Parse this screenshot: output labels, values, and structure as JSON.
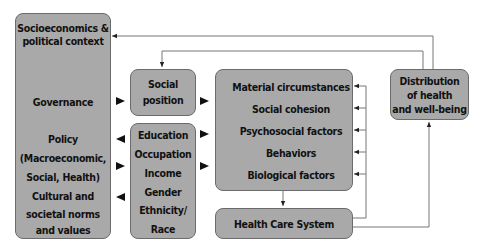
{
  "diagram": {
    "context_box": {
      "title_line1": "Socioeconomics &",
      "title_line2": "political context",
      "governance": "Governance",
      "policy_line1": "Policy",
      "policy_line2": "(Macroeconomic,",
      "policy_line3": "Social, Health)",
      "culture_line1": "Cultural and",
      "culture_line2": "societal norms",
      "culture_line3": "and values"
    },
    "social_position_box": {
      "line1": "Social",
      "line2": "position"
    },
    "stratifiers_box": {
      "items": [
        "Education",
        "Occupation",
        "Income",
        "Gender",
        "Ethnicity/",
        "Race"
      ]
    },
    "intermediary_box": {
      "items": [
        "Material circumstances",
        "Social cohesion",
        "Psychosocial factors",
        "Behaviors",
        "Biological factors"
      ]
    },
    "health_care_box": {
      "label": "Health Care System"
    },
    "outcome_box": {
      "line1": "Distribution",
      "line2": "of health",
      "line3": "and well-being"
    },
    "colors": {
      "box_fill": "#a9a9a9",
      "box_border": "#6b6b6b",
      "line": "#6b6b6b",
      "arrow": "#111111"
    }
  }
}
